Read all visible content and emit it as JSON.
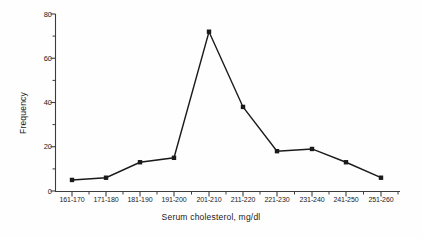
{
  "chart_data": {
    "type": "line",
    "title": "",
    "xlabel": "Serum cholesterol, mg/dl",
    "ylabel": "Frequency",
    "categories": [
      "161-170",
      "171-180",
      "181-190",
      "191-200",
      "201-210",
      "211-220",
      "221-230",
      "231-240",
      "241-250",
      "251-260"
    ],
    "values": [
      5,
      6,
      13,
      15,
      72,
      38,
      18,
      19,
      13,
      6
    ],
    "series": [
      {
        "name": "Frequency",
        "values": [
          5,
          6,
          13,
          15,
          72,
          38,
          18,
          19,
          13,
          6
        ]
      }
    ],
    "ylim": [
      0,
      80
    ],
    "yticks": [
      0,
      20,
      40,
      60,
      80
    ],
    "ytick_labels": [
      "0",
      "20",
      "40",
      "60",
      "80"
    ],
    "yminor_interval": 10,
    "grid": false,
    "legend": "none",
    "marker": "square",
    "line_color": "#1a1a1a",
    "marker_color": "#1a1a1a",
    "axis_color": "#4a4a4a",
    "background": "#ffffff"
  }
}
